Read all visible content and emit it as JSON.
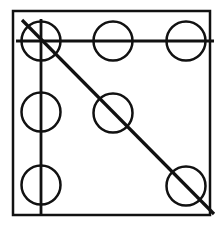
{
  "figure": {
    "canvas": {
      "width": 224,
      "height": 229,
      "background": "#ffffff"
    },
    "ink_color": "#111111",
    "frame": {
      "name": "outer-square",
      "x": 13,
      "y": 11,
      "width": 197,
      "height": 204,
      "stroke_width": 2.5
    },
    "circles": [
      {
        "id": "circle-top-left",
        "row": 0,
        "col": 0,
        "cx": 41,
        "cy": 41,
        "r": 19.5,
        "stroke_width": 2.5
      },
      {
        "id": "circle-top-center",
        "row": 0,
        "col": 1,
        "cx": 113,
        "cy": 41,
        "r": 19.5,
        "stroke_width": 2.5
      },
      {
        "id": "circle-top-right",
        "row": 0,
        "col": 2,
        "cx": 186,
        "cy": 41,
        "r": 19.5,
        "stroke_width": 2.5
      },
      {
        "id": "circle-middle-left",
        "row": 1,
        "col": 0,
        "cx": 41,
        "cy": 112,
        "r": 19.5,
        "stroke_width": 2.5
      },
      {
        "id": "circle-middle-center",
        "row": 1,
        "col": 1,
        "cx": 113,
        "cy": 113,
        "r": 19.5,
        "stroke_width": 2.5
      },
      {
        "id": "circle-bottom-left",
        "row": 2,
        "col": 0,
        "cx": 41,
        "cy": 185,
        "r": 19.5,
        "stroke_width": 2.5
      },
      {
        "id": "circle-bottom-right",
        "row": 2,
        "col": 2,
        "cx": 186,
        "cy": 186,
        "r": 19.5,
        "stroke_width": 2.5
      }
    ],
    "lines": [
      {
        "id": "horizontal-line",
        "orientation": "horizontal",
        "x1": 16,
        "y1": 41,
        "x2": 214,
        "y2": 41,
        "stroke_width": 2.8,
        "passes_through": [
          "circle-top-left",
          "circle-top-center",
          "circle-top-right"
        ]
      },
      {
        "id": "vertical-line",
        "orientation": "vertical",
        "x1": 41,
        "y1": 19,
        "x2": 41,
        "y2": 216,
        "stroke_width": 2.8,
        "passes_through": [
          "circle-top-left",
          "circle-middle-left",
          "circle-bottom-left"
        ]
      },
      {
        "id": "diagonal-line",
        "orientation": "diagonal",
        "x1": 22,
        "y1": 20,
        "x2": 214,
        "y2": 214,
        "stroke_width": 3.2,
        "passes_through": [
          "circle-top-left",
          "circle-middle-center",
          "circle-bottom-right"
        ]
      }
    ]
  }
}
